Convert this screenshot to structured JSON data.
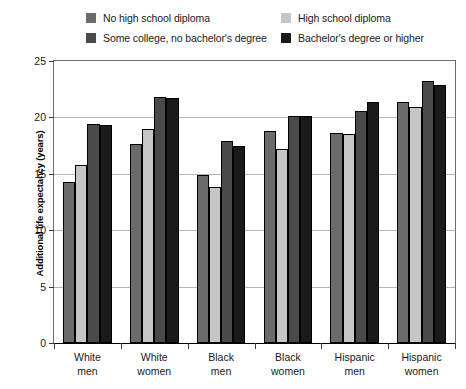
{
  "chart_data": {
    "type": "bar",
    "title": "",
    "xlabel": "",
    "ylabel": "Additional life expectancy (years)",
    "ylim": [
      0,
      25
    ],
    "yticks": [
      0,
      5,
      10,
      15,
      20,
      25
    ],
    "ytick_labels": [
      "0",
      "5",
      "10",
      "15",
      "20",
      "25"
    ],
    "grid": true,
    "legend_position": "top",
    "categories": [
      "White\nmen",
      "White\nwomen",
      "Black\nmen",
      "Black\nwomen",
      "Hispanic\nmen",
      "Hispanic\nwomen"
    ],
    "category_lines": [
      [
        "White",
        "men"
      ],
      [
        "White",
        "women"
      ],
      [
        "Black",
        "men"
      ],
      [
        "Black",
        "women"
      ],
      [
        "Hispanic",
        "men"
      ],
      [
        "Hispanic",
        "women"
      ]
    ],
    "series": [
      {
        "name": "No high school diploma",
        "color": "#6b6b6b",
        "values": [
          14.3,
          17.6,
          14.9,
          18.8,
          18.6,
          21.4
        ]
      },
      {
        "name": "High school diploma",
        "color": "#c6c6c6",
        "values": [
          15.8,
          19.0,
          13.8,
          17.2,
          18.5,
          20.9
        ]
      },
      {
        "name": "Some college, no bachelor's degree",
        "color": "#4a4a4a",
        "values": [
          19.4,
          21.8,
          17.9,
          20.1,
          20.6,
          23.2
        ]
      },
      {
        "name": "Bachelor's degree or higher",
        "color": "#1a1a1a",
        "values": [
          19.3,
          21.7,
          17.5,
          20.1,
          21.4,
          22.9
        ]
      }
    ]
  },
  "legend": {
    "items": [
      {
        "label": "No high school diploma",
        "color": "#6b6b6b"
      },
      {
        "label": "High school diploma",
        "color": "#c6c6c6"
      },
      {
        "label": "Some college, no bachelor's degree",
        "color": "#4a4a4a"
      },
      {
        "label": "Bachelor's degree or higher",
        "color": "#1a1a1a"
      }
    ]
  },
  "colors": {
    "background": "#ffffff",
    "gridline": "#b4b4b4",
    "axis": "#000000",
    "frame": "#6e6e6e",
    "text": "#1a1a1a"
  }
}
